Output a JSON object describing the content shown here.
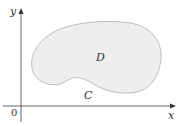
{
  "diagram": {
    "axes": {
      "x_label": "x",
      "y_label": "y",
      "origin_label": "0"
    },
    "region": {
      "label": "D",
      "fill": "#eeeeee",
      "stroke": "#bdbdbd"
    },
    "boundary_curve": {
      "label": "C"
    },
    "axis_color": "#555555"
  }
}
